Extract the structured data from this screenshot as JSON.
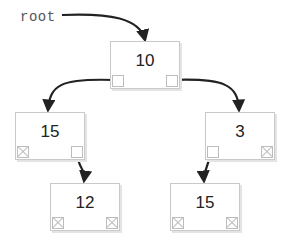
{
  "diagram": {
    "type": "binary-tree",
    "root_label": "root",
    "colors": {
      "arrow": "#222222",
      "node_border": "#c9c9c9",
      "label_text": "#555555",
      "value_text": "#222222"
    },
    "nodes": [
      {
        "id": "n10",
        "value": "10",
        "left": "n15a",
        "right": "n3"
      },
      {
        "id": "n15a",
        "value": "15",
        "left": null,
        "right": "n12"
      },
      {
        "id": "n3",
        "value": "3",
        "left": "n15b",
        "right": null
      },
      {
        "id": "n12",
        "value": "12",
        "left": null,
        "right": null
      },
      {
        "id": "n15b",
        "value": "15",
        "left": null,
        "right": null
      }
    ]
  }
}
